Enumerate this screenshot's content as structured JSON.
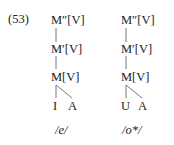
{
  "example_number": "(53)",
  "trees": [
    {
      "nodes": [
        "M″[V]",
        "M′[V]",
        "M[V]"
      ],
      "leaves": [
        "I",
        "A"
      ],
      "phoneme": "/e/"
    },
    {
      "nodes": [
        "M″[V]",
        "M′[V]",
        "M[V]"
      ],
      "leaves": [
        "U",
        "A"
      ],
      "phoneme": "/o*/"
    }
  ]
}
